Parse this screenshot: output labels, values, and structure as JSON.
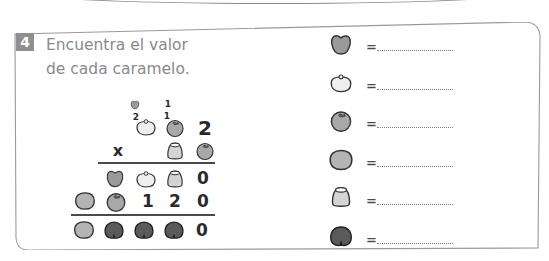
{
  "exercise": {
    "number": "4",
    "title_line1": "Encuentra el valor",
    "title_line2": "de cada caramelo."
  },
  "colors": {
    "badge": "#8f8f8f",
    "title_text": "#8a8a8a",
    "candy_heart": "#9a9a9a",
    "candy_white": "#eeeeee",
    "candy_tomato": "#a8a8a8",
    "candy_gray": "#b4b4b4",
    "candy_bell": "#d4d4d4",
    "candy_dark": "#5a5a5a",
    "outline": "#333333"
  },
  "multiplication": {
    "carries": {
      "top_heart_small": "heart-candy",
      "top_one": "1",
      "second_two": "2",
      "second_one": "1"
    },
    "row1": [
      "white-candy",
      "tomato-candy",
      "2"
    ],
    "operator": "x",
    "row2": [
      "bell-candy",
      "tomato-candy"
    ],
    "partial1": [
      "heart-candy",
      "white-candy",
      "bell-candy",
      "0"
    ],
    "partial2": [
      "gray-candy",
      "tomato-candy",
      "1",
      "2",
      "0"
    ],
    "result": [
      "gray-candy",
      "dark-candy",
      "dark-candy",
      "dark-candy",
      "0"
    ]
  },
  "legend": {
    "equals": "=",
    "items": [
      {
        "candy": "heart-candy",
        "value": ""
      },
      {
        "candy": "white-candy",
        "value": ""
      },
      {
        "candy": "tomato-candy",
        "value": ""
      },
      {
        "candy": "gray-candy",
        "value": ""
      },
      {
        "candy": "bell-candy",
        "value": ""
      },
      {
        "candy": "dark-candy",
        "value": ""
      }
    ]
  }
}
